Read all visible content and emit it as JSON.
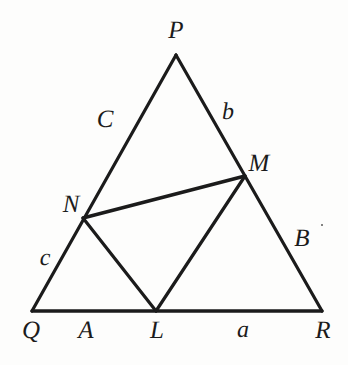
{
  "figure": {
    "background_color": "#fdfdfc",
    "stroke_color": "#1b1b1b",
    "canvas": {
      "width": 348,
      "height": 365
    }
  },
  "geometry": {
    "points": {
      "P": {
        "x": 176,
        "y": 55
      },
      "Q": {
        "x": 32,
        "y": 311
      },
      "R": {
        "x": 322,
        "y": 311
      },
      "L": {
        "x": 156,
        "y": 311
      },
      "M": {
        "x": 245,
        "y": 176
      },
      "N": {
        "x": 83,
        "y": 218
      }
    },
    "edges": [
      {
        "name": "PQ",
        "from": "P",
        "to": "Q"
      },
      {
        "name": "PR",
        "from": "P",
        "to": "R"
      },
      {
        "name": "QR",
        "from": "Q",
        "to": "R"
      },
      {
        "name": "NM",
        "from": "N",
        "to": "M"
      },
      {
        "name": "NL",
        "from": "N",
        "to": "L"
      },
      {
        "name": "LM",
        "from": "L",
        "to": "M"
      }
    ]
  },
  "labels": {
    "vertex_P": {
      "text": "P",
      "x": 176,
      "y": 30
    },
    "vertex_Q": {
      "text": "Q",
      "x": 31,
      "y": 330
    },
    "vertex_R": {
      "text": "R",
      "x": 323,
      "y": 330
    },
    "point_L": {
      "text": "L",
      "x": 157,
      "y": 330
    },
    "point_M": {
      "text": "M",
      "x": 259,
      "y": 163
    },
    "point_N": {
      "text": "N",
      "x": 71,
      "y": 204
    },
    "side_C": {
      "text": "C",
      "x": 105,
      "y": 119
    },
    "side_b": {
      "text": "b",
      "x": 228,
      "y": 112
    },
    "side_B": {
      "text": "B",
      "x": 302,
      "y": 238
    },
    "side_c": {
      "text": "c",
      "x": 45,
      "y": 258
    },
    "side_A": {
      "text": "A",
      "x": 86,
      "y": 330
    },
    "side_a": {
      "text": "a",
      "x": 243,
      "y": 330
    }
  },
  "marks": {
    "speck": {
      "x": 322,
      "y": 225
    }
  }
}
